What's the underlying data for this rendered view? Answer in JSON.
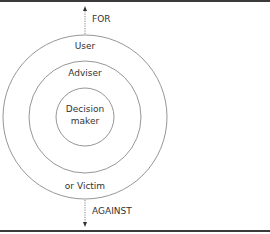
{
  "diagram": {
    "outer_ring_label": "User",
    "middle_ring_label": "Adviser",
    "inner_label_line1": "Decision",
    "inner_label_line2": "maker",
    "bottom_ring_label": "or Victim",
    "arrow_up_label": "FOR",
    "arrow_down_label": "AGAINST"
  },
  "colors": {
    "line": "#8a8a8a",
    "text": "#333333",
    "border": "#3a3a3a"
  }
}
